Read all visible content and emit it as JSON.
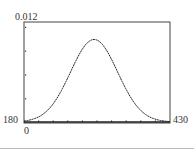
{
  "chart_data": {
    "type": "line",
    "title": "",
    "xlabel": "",
    "ylabel": "",
    "xlim": [
      180,
      430
    ],
    "ylim": [
      0,
      0.012
    ],
    "grid": false,
    "legend": null,
    "tick_labels": {
      "ymax": "0.012",
      "ymin": "0",
      "xmin": "180",
      "xmax": "430"
    },
    "series": [
      {
        "name": "normal density curve",
        "x": [
          180,
          200,
          220,
          240,
          260,
          280,
          300,
          320,
          340,
          360,
          380,
          400,
          420,
          430
        ],
        "values": [
          0.0003,
          0.0009,
          0.0021,
          0.0041,
          0.0066,
          0.0089,
          0.0099,
          0.0089,
          0.0066,
          0.0041,
          0.0021,
          0.0009,
          0.0003,
          0.0002
        ]
      }
    ],
    "peak": {
      "x": 300,
      "y": 0.0099
    },
    "x_ticks_count": 10,
    "y_ticks_count": 4
  },
  "labels": {
    "ymax": "0.012",
    "xmin": "180",
    "xmax": "430",
    "ymin": "0"
  }
}
